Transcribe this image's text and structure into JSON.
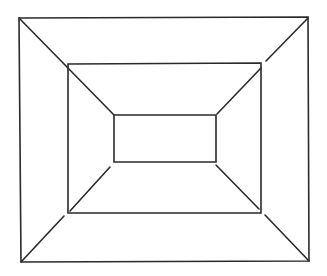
{
  "diagram": {
    "stroke_color": "#2a2a2a",
    "background": "#ffffff",
    "rectangles": {
      "outer": {
        "tl": [
          19,
          18
        ],
        "tr": [
          308,
          17
        ],
        "br": [
          309,
          261
        ],
        "bl": [
          21,
          262
        ]
      },
      "middle": {
        "tl": [
          68,
          64
        ],
        "tr": [
          261,
          63
        ],
        "br": [
          261,
          213
        ],
        "bl": [
          68,
          213
        ]
      },
      "inner": {
        "tl": [
          114,
          115
        ],
        "tr": [
          216,
          115
        ],
        "br": [
          216,
          162
        ],
        "bl": [
          114,
          162
        ]
      }
    }
  }
}
